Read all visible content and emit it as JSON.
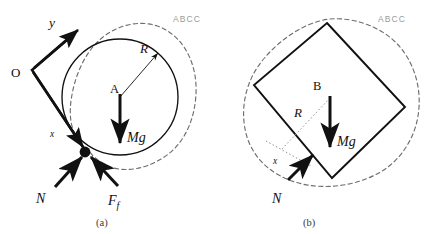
{
  "figure": {
    "background_color": "#ffffff",
    "stroke_color": "#111111",
    "dashed_color": "#6e6e6e",
    "dotted_color": "#8c8c8c",
    "watermark_color": "#9a9a9a",
    "caption_color": "#3b3b3b"
  },
  "panel_a": {
    "caption": "(a)",
    "watermark": "ABCC",
    "body_label": "A",
    "origin_label": "O",
    "axis_y_label": "y",
    "axis_x_label": "x",
    "radius_label": "R",
    "weight_label": "Mg",
    "normal_label": "N",
    "friction_label": "F",
    "friction_subscript": "f",
    "circle": {
      "cx": 120,
      "cy": 97,
      "r": 58
    },
    "contact_point": {
      "cx": 85,
      "cy": 152,
      "r": 5.4
    }
  },
  "panel_b": {
    "caption": "(b)",
    "watermark": "ABCC",
    "body_label": "B",
    "radius_label": "R",
    "weight_label": "Mg",
    "normal_label": "N",
    "axis_x_label": "x",
    "square_corners": {
      "top": "327,23",
      "left": "254,85",
      "bottom": "332,178",
      "right": "405,107"
    }
  }
}
